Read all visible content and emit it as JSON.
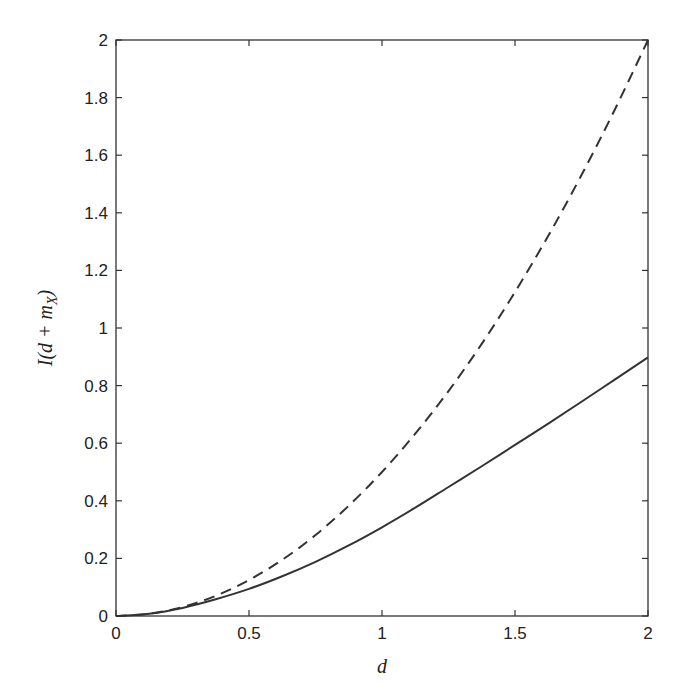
{
  "chart_data": {
    "type": "line",
    "title": "",
    "xlabel": "d",
    "ylabel": "I(d + m_X)",
    "ylabel_parts": {
      "pre": "I(d + m",
      "sub": "X",
      "post": ")"
    },
    "xlim": [
      0,
      2
    ],
    "ylim": [
      0,
      2
    ],
    "grid": false,
    "legend": null,
    "xticks": [
      0,
      0.5,
      1,
      1.5,
      2
    ],
    "xtick_labels": [
      "0",
      "0.5",
      "1",
      "1.5",
      "2"
    ],
    "yticks": [
      0,
      0.2,
      0.4,
      0.6,
      0.8,
      1,
      1.2,
      1.4,
      1.6,
      1.8,
      2
    ],
    "ytick_labels": [
      "0",
      "0.2",
      "0.4",
      "0.6",
      "0.8",
      "1",
      "1.2",
      "1.4",
      "1.6",
      "1.8",
      "2"
    ],
    "x": [
      0,
      0.125,
      0.25,
      0.375,
      0.5,
      0.625,
      0.75,
      0.875,
      1,
      1.125,
      1.25,
      1.375,
      1.5,
      1.625,
      1.75,
      1.875,
      2
    ],
    "series": [
      {
        "name": "solid",
        "style": "solid",
        "color": "#333333",
        "values": [
          0,
          0.008,
          0.028,
          0.058,
          0.094,
          0.138,
          0.188,
          0.245,
          0.308,
          0.376,
          0.448,
          0.52,
          0.594,
          0.668,
          0.744,
          0.821,
          0.898
        ]
      },
      {
        "name": "dashed",
        "style": "dashed",
        "color": "#333333",
        "values": [
          0,
          0.008,
          0.031,
          0.07,
          0.125,
          0.195,
          0.281,
          0.383,
          0.5,
          0.633,
          0.781,
          0.945,
          1.125,
          1.32,
          1.531,
          1.758,
          2.0
        ]
      }
    ]
  }
}
